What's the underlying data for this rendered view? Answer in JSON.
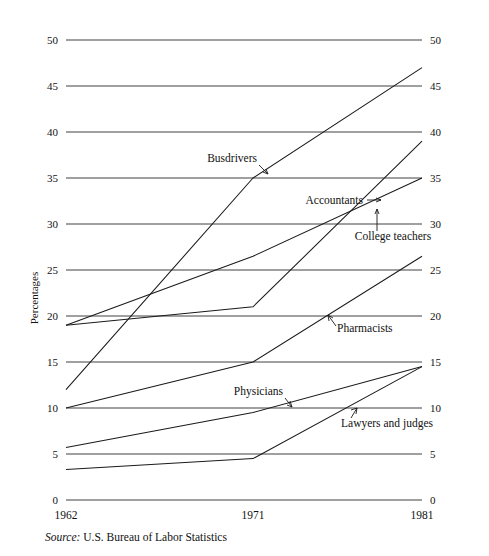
{
  "chart_data": {
    "type": "line",
    "title": "",
    "subtitle": "",
    "xlabel": "",
    "ylabel": "Percentages",
    "x": [
      1962,
      1971,
      1981
    ],
    "xtick_labels": [
      "1962",
      "1971",
      "1981"
    ],
    "ytick_labels": [
      "0",
      "5",
      "10",
      "15",
      "20",
      "25",
      "30",
      "35",
      "40",
      "45",
      "50"
    ],
    "ytick_values": [
      0,
      5,
      10,
      15,
      20,
      25,
      30,
      35,
      40,
      45,
      50
    ],
    "ylim": [
      0,
      50
    ],
    "grid": "horizontal",
    "y_axis_both_sides": true,
    "legend": "inline-annotations",
    "series": [
      {
        "name": "Busdrivers",
        "values": [
          12.0,
          35.0,
          47.0
        ]
      },
      {
        "name": "Accountants",
        "values": [
          19.0,
          21.0,
          39.0
        ]
      },
      {
        "name": "College teachers",
        "values": [
          19.0,
          26.5,
          35.0
        ]
      },
      {
        "name": "Pharmacists",
        "values": [
          10.0,
          15.0,
          26.5
        ]
      },
      {
        "name": "Physicians",
        "values": [
          5.7,
          9.5,
          14.5
        ]
      },
      {
        "name": "Lawyers and judges",
        "values": [
          3.3,
          4.5,
          14.5
        ]
      }
    ],
    "annotations": [
      {
        "text": "Busdrivers",
        "series": "Busdrivers"
      },
      {
        "text": "Accountants",
        "series": "Accountants"
      },
      {
        "text": "College teachers",
        "series": "College teachers"
      },
      {
        "text": "Pharmacists",
        "series": "Pharmacists"
      },
      {
        "text": "Physicians",
        "series": "Physicians"
      },
      {
        "text": "Lawyers and judges",
        "series": "Lawyers and judges"
      }
    ]
  },
  "axis": {
    "y_label": "Percentages",
    "y_ticks_left": [
      "50",
      "45",
      "40",
      "35",
      "30",
      "25",
      "20",
      "15",
      "10",
      "5",
      "0"
    ],
    "y_ticks_right": [
      "50",
      "45",
      "40",
      "35",
      "30",
      "25",
      "20",
      "15",
      "10",
      "5",
      "0"
    ],
    "x_ticks": [
      "1962",
      "1971",
      "1981"
    ]
  },
  "labels": {
    "busdrivers": "Busdrivers",
    "accountants": "Accountants",
    "college_teachers": "College teachers",
    "pharmacists": "Pharmacists",
    "physicians": "Physicians",
    "lawyers_and_judges": "Lawyers and judges"
  },
  "footer": {
    "source_word": "Source:",
    "source_text": "U.S. Bureau of Labor Statistics"
  },
  "colors": {
    "line": "#1a1a1a",
    "grid": "#2b2b2b",
    "text": "#111111",
    "background": "#ffffff"
  }
}
